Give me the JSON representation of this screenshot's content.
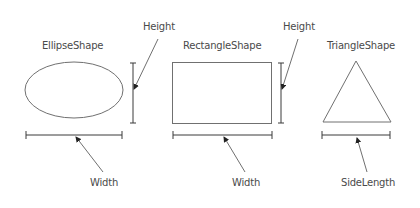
{
  "diagram": {
    "shapes": [
      {
        "id": "ellipse",
        "title": "EllipseShape",
        "kind": "ellipse",
        "dimensions": [
          {
            "label": "Height",
            "orientation": "vertical"
          },
          {
            "label": "Width",
            "orientation": "horizontal"
          }
        ]
      },
      {
        "id": "rectangle",
        "title": "RectangleShape",
        "kind": "rectangle",
        "dimensions": [
          {
            "label": "Height",
            "orientation": "vertical"
          },
          {
            "label": "Width",
            "orientation": "horizontal"
          }
        ]
      },
      {
        "id": "triangle",
        "title": "TriangleShape",
        "kind": "triangle",
        "dimensions": [
          {
            "label": "SideLength",
            "orientation": "horizontal"
          }
        ]
      }
    ],
    "colors": {
      "background": "#ffffff",
      "shape_stroke": "#707070",
      "dimension_stroke": "#3a3a3a",
      "arrow_stroke": "#707070",
      "text": "#4a4a4a"
    }
  }
}
